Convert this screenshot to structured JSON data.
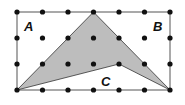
{
  "figure": {
    "grid": {
      "columns": 7,
      "rows": 4,
      "x_positions": [
        17,
        42.5,
        68,
        93.5,
        119,
        144.5,
        170
      ],
      "y_positions": [
        12,
        38,
        64,
        90
      ],
      "dot_color": "#111111",
      "border_color": "#555555"
    },
    "shaded_polygon": {
      "vertices_grid": [
        [
          0,
          3
        ],
        [
          3,
          0
        ],
        [
          4,
          1
        ],
        [
          6,
          3
        ],
        [
          4,
          2
        ]
      ],
      "fill": "#bdbdbd",
      "stroke": "#333333"
    },
    "labels": [
      {
        "text": "A",
        "x": 24,
        "y": 31
      },
      {
        "text": "B",
        "x": 153,
        "y": 31
      },
      {
        "text": "C",
        "x": 101,
        "y": 86
      }
    ]
  }
}
